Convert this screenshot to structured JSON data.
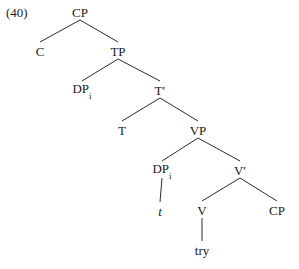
{
  "figure": {
    "example_number": "(40)",
    "background_color": "#ffffff",
    "line_color": "#2b2b2b",
    "text_color": "#1a1a1a",
    "width": 299,
    "height": 269
  },
  "tree": {
    "type": "syntax-tree",
    "nodes": [
      {
        "id": "cp-root",
        "label": "CP",
        "sub": "",
        "italic": false,
        "x": 80,
        "y": 12
      },
      {
        "id": "c-head",
        "label": "C",
        "sub": "",
        "italic": false,
        "x": 40,
        "y": 51
      },
      {
        "id": "tp",
        "label": "TP",
        "sub": "",
        "italic": false,
        "x": 118,
        "y": 51
      },
      {
        "id": "dp-spec",
        "label": "DP",
        "sub": "i",
        "italic": false,
        "x": 82,
        "y": 90
      },
      {
        "id": "t-bar",
        "label": "T′",
        "sub": "",
        "italic": false,
        "x": 160,
        "y": 90
      },
      {
        "id": "t-head",
        "label": "T",
        "sub": "",
        "italic": false,
        "x": 122,
        "y": 130
      },
      {
        "id": "vp",
        "label": "VP",
        "sub": "",
        "italic": false,
        "x": 198,
        "y": 130
      },
      {
        "id": "dp-object",
        "label": "DP",
        "sub": "i",
        "italic": false,
        "x": 162,
        "y": 170
      },
      {
        "id": "v-bar",
        "label": "V′",
        "sub": "",
        "italic": false,
        "x": 240,
        "y": 170
      },
      {
        "id": "trace",
        "label": "t",
        "sub": "",
        "italic": true,
        "x": 160,
        "y": 211
      },
      {
        "id": "v-head",
        "label": "V",
        "sub": "",
        "italic": false,
        "x": 202,
        "y": 210
      },
      {
        "id": "cp-comp",
        "label": "CP",
        "sub": "",
        "italic": false,
        "x": 277,
        "y": 210
      },
      {
        "id": "verb-try",
        "label": "try",
        "sub": "",
        "italic": false,
        "x": 202,
        "y": 250
      }
    ],
    "edges": [
      {
        "id": "cp-to-c",
        "from": "cp-root",
        "to": "c-head"
      },
      {
        "id": "cp-to-tp",
        "from": "cp-root",
        "to": "tp"
      },
      {
        "id": "tp-to-dp",
        "from": "tp",
        "to": "dp-spec"
      },
      {
        "id": "tp-to-tbar",
        "from": "tp",
        "to": "t-bar"
      },
      {
        "id": "tbar-to-t",
        "from": "t-bar",
        "to": "t-head"
      },
      {
        "id": "tbar-to-vp",
        "from": "t-bar",
        "to": "vp"
      },
      {
        "id": "vp-to-dp",
        "from": "vp",
        "to": "dp-object"
      },
      {
        "id": "vp-to-vbar",
        "from": "vp",
        "to": "v-bar"
      },
      {
        "id": "dp-to-trace",
        "from": "dp-object",
        "to": "trace"
      },
      {
        "id": "vbar-to-v",
        "from": "v-bar",
        "to": "v-head"
      },
      {
        "id": "vbar-to-cp",
        "from": "v-bar",
        "to": "cp-comp"
      },
      {
        "id": "v-to-try",
        "from": "v-head",
        "to": "verb-try"
      }
    ]
  }
}
